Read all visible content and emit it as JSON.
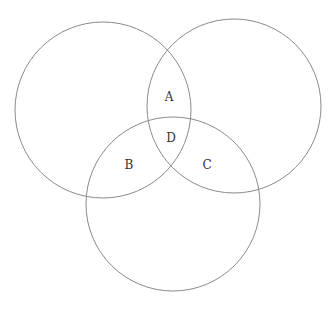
{
  "diagram": {
    "type": "venn",
    "circles": [
      {
        "name": "left",
        "cx": 103,
        "cy": 110,
        "r": 88
      },
      {
        "name": "right",
        "cx": 234,
        "cy": 106,
        "r": 87
      },
      {
        "name": "bottom",
        "cx": 173,
        "cy": 204,
        "r": 87
      }
    ],
    "labels": [
      {
        "text": "A",
        "x": 169,
        "y": 97
      },
      {
        "text": "D",
        "x": 171,
        "y": 138
      },
      {
        "text": "B",
        "x": 129,
        "y": 165
      },
      {
        "text": "C",
        "x": 207,
        "y": 165
      }
    ],
    "stroke_color": "#8a8a8a"
  }
}
